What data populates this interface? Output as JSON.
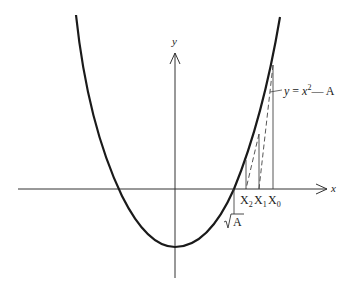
{
  "figure": {
    "curve_label_y": "y",
    "curve_label_eq": "=",
    "curve_label_x": "x",
    "curve_label_exp": "2",
    "curve_label_rest": "— A",
    "x_axis_label": "x",
    "y_axis_label": "y",
    "root_label_sqrt": "√",
    "root_label_A": "A",
    "iterates": [
      {
        "base": "X",
        "sub": "2"
      },
      {
        "base": "X",
        "sub": "1"
      },
      {
        "base": "X",
        "sub": "0"
      }
    ]
  },
  "colors": {
    "curve": "#1a1a1a",
    "axes": "#333333",
    "lines": "#444444"
  }
}
